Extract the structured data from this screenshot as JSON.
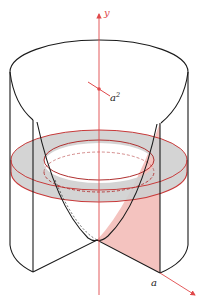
{
  "figure": {
    "type": "solid-of-revolution",
    "labels": {
      "y_axis": "y",
      "height_label_base": "a",
      "height_label_exp": "2",
      "x_radius_label": "a"
    },
    "colors": {
      "axis": "#e0484a",
      "outline": "#1a1a1a",
      "ring_fill": "#cfcfcf",
      "ring_edge": "#c83a3a",
      "cross_section_fill": "#f2b9b4"
    }
  }
}
